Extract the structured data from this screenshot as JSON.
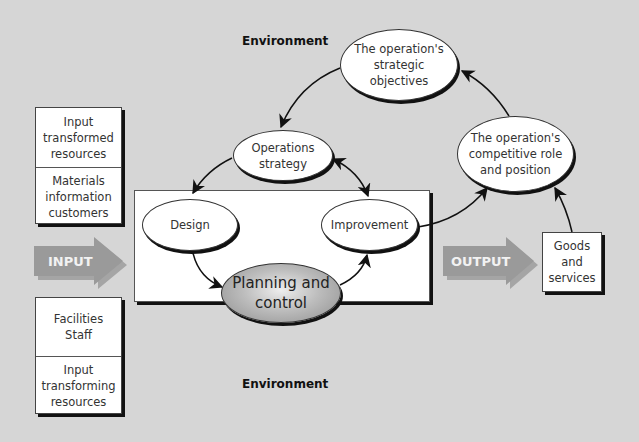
{
  "diagram": {
    "environment_top": "Environment",
    "environment_bottom": "Environment",
    "input_arrow_label": "INPUT",
    "output_arrow_label": "OUTPUT",
    "input_transformed": {
      "header": "Input\ntransformed\nresources",
      "items": "Materials\ninformation\ncustomers"
    },
    "input_transforming": {
      "items": "Facilities\nStaff",
      "footer": "Input\ntransforming\nresources"
    },
    "nodes": {
      "strategic_objectives": "The operation's\nstrategic\nobjectives",
      "operations_strategy": "Operations\nstrategy",
      "competitive_role": "The operation's\ncompetitive role\nand position",
      "design": "Design",
      "improvement": "Improvement",
      "planning_control": "Planning and\ncontrol"
    },
    "output_box": "Goods\nand\nservices",
    "colors": {
      "background": "#d6d6d6",
      "arrow_fill": "#9a9a9a",
      "planning_fill": "#a8a8a8"
    }
  }
}
